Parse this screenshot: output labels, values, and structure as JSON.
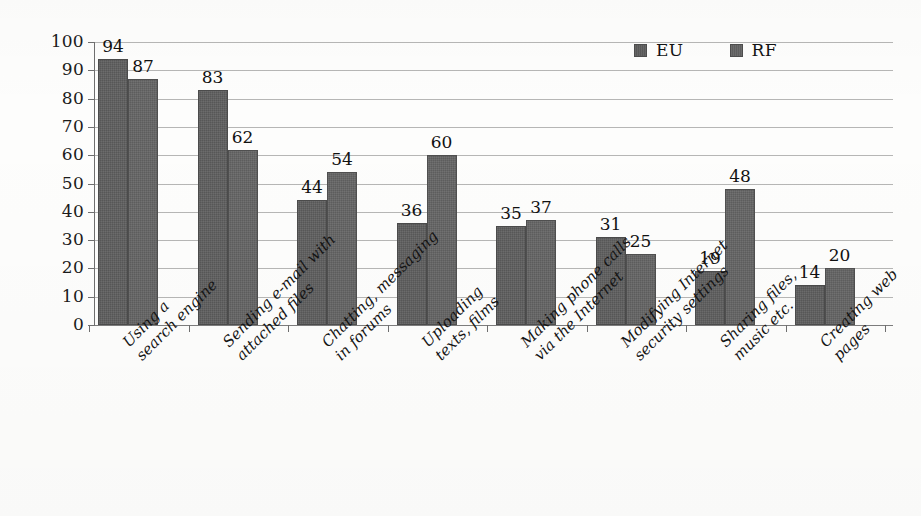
{
  "chart_data": {
    "type": "bar",
    "title": "",
    "subtitle": "",
    "xlabel": "",
    "ylabel": "",
    "ylim": [
      0,
      100
    ],
    "ytick_step": 10,
    "yticks": [
      100,
      90,
      80,
      70,
      60,
      50,
      40,
      30,
      20,
      10,
      0
    ],
    "grid": true,
    "legend_position": "top-right",
    "categories": [
      "Using a search engine",
      "Sending e-mail with attached files",
      "Chatting, messaging in forums",
      "Uploading texts, films",
      "Making phone calls via the Internet",
      "Modifying Internet security settings",
      "Sharing files, music etc.",
      "Creating web pages"
    ],
    "category_lines": [
      [
        "Using a",
        "search engine"
      ],
      [
        "Sending e-mail with",
        "attached files"
      ],
      [
        "Chatting, messaging",
        "in forums"
      ],
      [
        "Uploading",
        "texts, films"
      ],
      [
        "Making phone calls",
        "via the Internet"
      ],
      [
        "Modifying Internet",
        "security settings"
      ],
      [
        "Sharing files,",
        "music etc."
      ],
      [
        "Creating web",
        "pages"
      ]
    ],
    "series": [
      {
        "name": "EU",
        "color": "#5d5d5d",
        "values": [
          94,
          83,
          44,
          36,
          35,
          31,
          19,
          14
        ]
      },
      {
        "name": "RF",
        "color": "#636363",
        "values": [
          87,
          62,
          54,
          60,
          37,
          25,
          48,
          20
        ]
      }
    ]
  },
  "legend": {
    "items": [
      {
        "label": "EU",
        "color": "#5d5d5d"
      },
      {
        "label": "RF",
        "color": "#636363"
      }
    ]
  },
  "axis": {
    "y_tick_labels": [
      "100",
      "90",
      "80",
      "70",
      "60",
      "50",
      "40",
      "30",
      "20",
      "10",
      "0"
    ]
  }
}
